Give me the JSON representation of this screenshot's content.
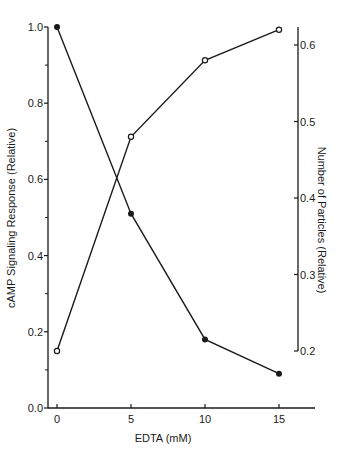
{
  "chart_data": {
    "type": "line",
    "title": "",
    "xlabel": "EDTA (mM)",
    "ylabel": "cAMP Signaling Response (Relative)",
    "ylabel_right": "Number of Particles (Relative)",
    "x": [
      0,
      5,
      10,
      15
    ],
    "x_ticks": [
      "0",
      "5",
      "10",
      "15"
    ],
    "xlim": [
      -1.2,
      17
    ],
    "ylim": [
      0.0,
      1.0
    ],
    "ylim_right": [
      0.2,
      0.6
    ],
    "y_ticks": [
      "0.0",
      "0.2",
      "0.4",
      "0.6",
      "0.8",
      "1.0"
    ],
    "y_ticks_right": [
      "0.2",
      "0.3",
      "0.4",
      "0.5",
      "0.6"
    ],
    "grid": false,
    "legend": "none",
    "series": [
      {
        "name": "cAMP Signaling Response",
        "axis": "left",
        "marker": "filled-circle",
        "values": [
          1.0,
          0.51,
          0.18,
          0.09
        ]
      },
      {
        "name": "Number of Particles",
        "axis": "right",
        "marker": "open-circle",
        "values": [
          0.2,
          0.48,
          0.58,
          0.62
        ]
      }
    ]
  },
  "colors": {
    "ink": "#1a1a1a",
    "background": "#ffffff"
  }
}
